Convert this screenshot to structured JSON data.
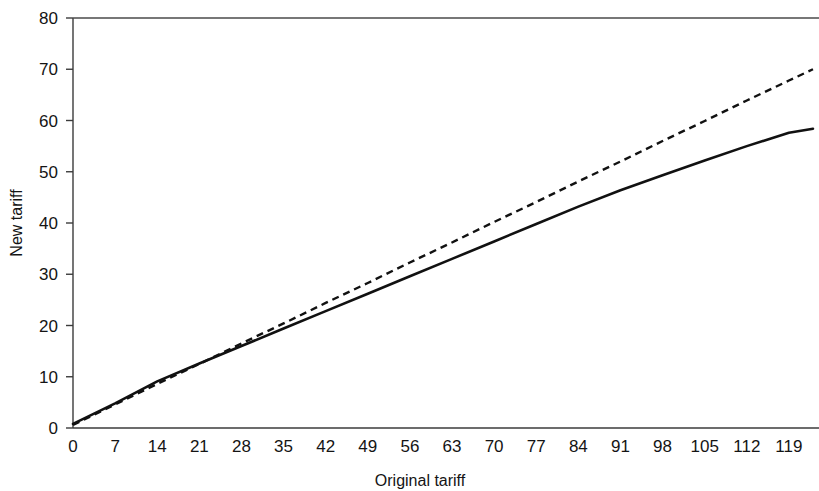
{
  "chart_data": {
    "type": "line",
    "title": "",
    "subtitle": "",
    "xlabel": "Original tariff",
    "ylabel": "New tariff",
    "xlim": [
      0,
      124
    ],
    "ylim": [
      0,
      80
    ],
    "grid": false,
    "legend": "none",
    "xticks": [
      0,
      7,
      14,
      21,
      28,
      35,
      42,
      49,
      56,
      63,
      70,
      77,
      84,
      91,
      98,
      105,
      112,
      119
    ],
    "xtick_labels": [
      "0",
      "7",
      "14",
      "21",
      "28",
      "35",
      "42",
      "49",
      "56",
      "63",
      "70",
      "77",
      "84",
      "91",
      "98",
      "105",
      "112",
      "119"
    ],
    "yticks": [
      0,
      10,
      20,
      30,
      40,
      50,
      60,
      70,
      80
    ],
    "ytick_labels": [
      "0",
      "10",
      "20",
      "30",
      "40",
      "50",
      "60",
      "70",
      "80"
    ],
    "series": [
      {
        "name": "reference-linear",
        "style": "dashed",
        "color": "#111111",
        "x": [
          0,
          7,
          14,
          21,
          28,
          35,
          42,
          49,
          56,
          63,
          70,
          77,
          84,
          91,
          98,
          105,
          112,
          119,
          123
        ],
        "values": [
          0.6,
          4.6,
          8.6,
          12.5,
          16.5,
          20.4,
          24.4,
          28.3,
          32.3,
          36.2,
          40.2,
          44.1,
          48.1,
          52.0,
          56.0,
          59.9,
          63.9,
          67.8,
          70.0
        ]
      },
      {
        "name": "new-tariff-schedule",
        "style": "solid",
        "color": "#111111",
        "x": [
          0,
          7,
          14,
          21,
          28,
          35,
          42,
          49,
          56,
          63,
          70,
          77,
          84,
          91,
          98,
          105,
          112,
          119,
          123
        ],
        "values": [
          0.8,
          4.8,
          9.1,
          12.6,
          16.0,
          19.4,
          22.8,
          26.2,
          29.6,
          33.0,
          36.4,
          39.8,
          43.2,
          46.4,
          49.3,
          52.2,
          55.0,
          57.6,
          58.4
        ]
      }
    ]
  },
  "axes": {
    "y_axis_title": "New tariff",
    "x_axis_title": "Original tariff"
  }
}
